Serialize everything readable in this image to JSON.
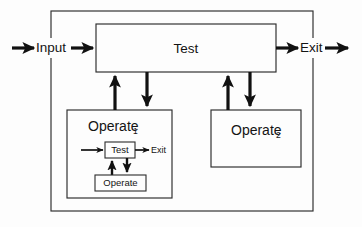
{
  "figure": {
    "type": "flowchart-diagram",
    "title_visible": false,
    "background_color": "#fdfdfd",
    "line_color": "#111111",
    "box_stroke_color": "#2b2b2b"
  },
  "io": {
    "input_label": "Input",
    "exit_label": "Exit"
  },
  "main_test": {
    "label": "Test"
  },
  "operate_1": {
    "label": "Operate",
    "subscript": "1",
    "inner": {
      "test_label": "Test",
      "operate_label": "Operate",
      "exit_label": "Exit"
    }
  },
  "operate_2": {
    "label": "Operate",
    "subscript": "2"
  },
  "connections": [
    {
      "name": "input-to-frame",
      "label": "Input"
    },
    {
      "name": "frame-to-test",
      "label": "Input"
    },
    {
      "name": "test-to-exit",
      "label": "Exit"
    },
    {
      "name": "exit-out-of-frame",
      "label": "Exit"
    },
    {
      "name": "operate1-up-to-test",
      "label": ""
    },
    {
      "name": "test-down-to-operate1",
      "label": ""
    },
    {
      "name": "operate2-up-to-test",
      "label": ""
    },
    {
      "name": "test-down-to-operate2",
      "label": ""
    },
    {
      "name": "inner-input-to-test",
      "label": ""
    },
    {
      "name": "inner-test-to-exit",
      "label": "Exit"
    },
    {
      "name": "inner-operate-up-to-test",
      "label": ""
    },
    {
      "name": "inner-test-down-to-operate",
      "label": ""
    }
  ]
}
